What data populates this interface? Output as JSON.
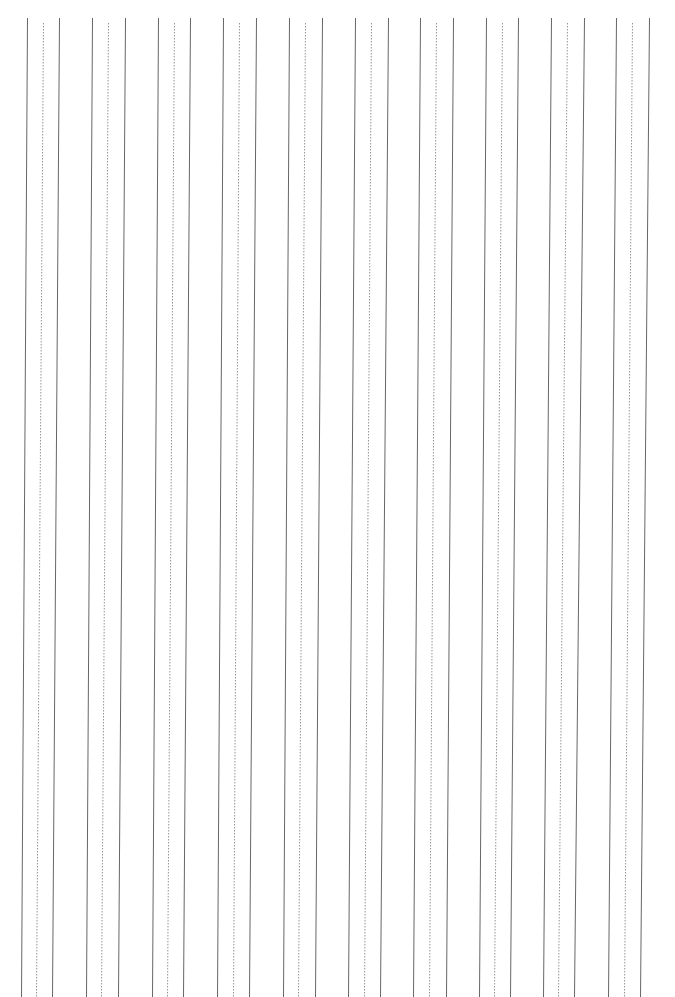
{
  "page": {
    "width": 675,
    "height": 997,
    "background": "#ffffff"
  },
  "ruling": {
    "orientation": "vertical",
    "line_color": "#555555",
    "dashed_color": "#777777",
    "top_y": 18,
    "dashed_top_y": 23,
    "bottom_y": 997,
    "groups": [
      {
        "top": [
          27,
          43,
          59
        ],
        "bottom": [
          21,
          36,
          52
        ]
      },
      {
        "top": [
          92,
          108,
          125
        ],
        "bottom": [
          86,
          101,
          118
        ]
      },
      {
        "top": [
          158,
          174,
          190
        ],
        "bottom": [
          152,
          167,
          183
        ]
      },
      {
        "top": [
          223,
          239,
          256
        ],
        "bottom": [
          217,
          233,
          249
        ]
      },
      {
        "top": [
          289,
          305,
          322
        ],
        "bottom": [
          283,
          298,
          315
        ]
      },
      {
        "top": [
          355,
          371,
          388
        ],
        "bottom": [
          348,
          364,
          380
        ]
      },
      {
        "top": [
          420,
          436,
          453
        ],
        "bottom": [
          413,
          429,
          446
        ]
      },
      {
        "top": [
          486,
          502,
          518
        ],
        "bottom": [
          479,
          494,
          510
        ]
      },
      {
        "top": [
          551,
          567,
          584
        ],
        "bottom": [
          543,
          558,
          574
        ]
      },
      {
        "top": [
          616,
          632,
          649
        ],
        "bottom": [
          608,
          624,
          640
        ]
      }
    ]
  }
}
